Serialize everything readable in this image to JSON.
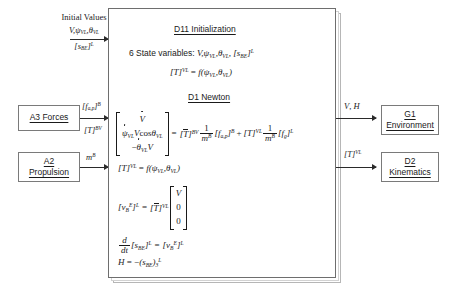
{
  "diagram": {
    "accent_color": "#1a1a1a",
    "box_border_color": "#7a7a7a"
  },
  "initial_values": {
    "heading": "Initial Values",
    "line_1_V": "V",
    "line_1_psi": "ψ",
    "line_1_psi_sub": "VL",
    "line_1_theta": "θ",
    "line_1_theta_sub": "VL",
    "line_2_symbol": "s",
    "line_2_sub": "BE",
    "line_2_sup": "L"
  },
  "main_block": {
    "section_1_title": "D11 Initialization",
    "state_vars_prefix": "6 State variables:",
    "state_vars_V": "V",
    "state_vars_psi": "ψ",
    "state_vars_psi_sub": "VL",
    "state_vars_theta": "θ",
    "state_vars_theta_sub": "VL",
    "state_vars_s": "s",
    "state_vars_s_sub": "BE",
    "state_vars_s_sup": "L",
    "eq_T_lhs_T": "T",
    "eq_T_lhs_sup": "VL",
    "eq_T_equals": "=",
    "eq_T_f": "f",
    "eq_T_arg_psi": "ψ",
    "eq_T_arg_psi_sub": "VL",
    "eq_T_arg_theta": "θ",
    "eq_T_arg_theta_sub": "VL",
    "section_2_title": "D1 Newton",
    "newton_lhs_row1": "V",
    "newton_lhs_row2_psi": "ψ",
    "newton_lhs_row2_psi_sub": "VL",
    "newton_lhs_row2_rest_V": "V",
    "newton_lhs_row2_cos": "cos",
    "newton_lhs_row2_theta": "θ",
    "newton_lhs_row2_theta_sub": "VL",
    "newton_lhs_row3_minus": "−",
    "newton_lhs_row3_theta": "θ",
    "newton_lhs_row3_theta_sub": "VL",
    "newton_lhs_row3_V": "V",
    "newton_equals": "=",
    "newton_T1": "T",
    "newton_T1_sup": "BV",
    "newton_frac_num": "1",
    "newton_frac_den_m": "m",
    "newton_frac_den_sup": "B",
    "newton_f_ap": "f",
    "newton_f_ap_sub": "a,p",
    "newton_f_ap_sup": "B",
    "newton_plus": "+",
    "newton_T2": "T",
    "newton_T2_sup": "VL",
    "newton_frac2_num": "1",
    "newton_frac2_den_m": "m",
    "newton_frac2_den_sup": "B",
    "newton_f_g": "f",
    "newton_f_g_sub": "g",
    "newton_f_g_sup": "L",
    "eq2_T": "T",
    "eq2_T_sup": "VL",
    "eq2_equals": "=",
    "eq2_f": "f",
    "eq2_psi": "ψ",
    "eq2_psi_sub": "VL",
    "eq2_theta": "θ",
    "eq2_theta_sub": "VL",
    "eq3_v": "v",
    "eq3_v_sub": "B",
    "eq3_v_sup": "E",
    "eq3_v_brk_sup": "L",
    "eq3_equals": "=",
    "eq3_T": "T",
    "eq3_T_sup": "VL",
    "eq3_vec_1": "V",
    "eq3_vec_2": "0",
    "eq3_vec_3": "0",
    "eq4_d": "d",
    "eq4_dt": "dt",
    "eq4_s": "s",
    "eq4_s_sub": "BE",
    "eq4_s_sup": "L",
    "eq4_equals": "=",
    "eq4_v": "v",
    "eq4_v_sub": "B",
    "eq4_v_sup": "E",
    "eq4_v_brk_sup": "L",
    "eq5_H": "H",
    "eq5_equals": "=",
    "eq5_minus": "−",
    "eq5_s": "s",
    "eq5_s_sub": "BE",
    "eq5_s_sub2": "3",
    "eq5_s_sup": "L"
  },
  "left_blocks": [
    {
      "name": "a3-forces",
      "line_1": "A3 Forces",
      "line_2": ""
    },
    {
      "name": "a2-propulsion",
      "line_1": "A2",
      "line_2": "Propulsion"
    }
  ],
  "right_blocks": [
    {
      "name": "g1-environment",
      "line_1": "G1",
      "line_2": "Environment"
    },
    {
      "name": "d2-kinematics",
      "line_1": "D2",
      "line_2": "Kinematics"
    }
  ],
  "edge_labels": {
    "forces_f": "f",
    "forces_f_sub": "a,p",
    "forces_f_sup": "B",
    "forces_T": "T",
    "forces_T_sup": "BV",
    "propulsion_m": "m",
    "propulsion_m_sup": "B",
    "env_V": "V",
    "env_comma": ",",
    "env_H": "H",
    "kin_T": "T",
    "kin_T_sup": "VL"
  }
}
